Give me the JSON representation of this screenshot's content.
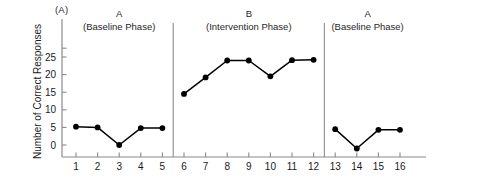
{
  "panel_label": "(A)",
  "chart_data": {
    "type": "line",
    "title": "",
    "subtitle": "",
    "xlabel": "",
    "ylabel": "Number of Correct Responses",
    "x": [
      1,
      2,
      3,
      4,
      5,
      6,
      7,
      8,
      9,
      10,
      11,
      12,
      13,
      14,
      15,
      16
    ],
    "xtick_labels": [
      "1",
      "2",
      "3",
      "4",
      "5",
      "6",
      "7",
      "8",
      "9",
      "10",
      "11",
      "12",
      "13",
      "14",
      "15",
      "16"
    ],
    "ytick_labels": [
      "0",
      "5",
      "10",
      "15",
      "20",
      "25"
    ],
    "yticks": [
      0,
      5,
      10,
      15,
      20,
      25
    ],
    "ylim": [
      -2.5,
      28
    ],
    "xlim": [
      0.4,
      17.2
    ],
    "grid": false,
    "legend": null,
    "marker": "filled-circle",
    "line_color": "#000000",
    "marker_color": "#000000",
    "axis_color": "#8a8a8a",
    "series": [
      {
        "name": "A (Baseline Phase)",
        "x": [
          1,
          2,
          3,
          4,
          5
        ],
        "values": [
          5.2,
          5.0,
          0.0,
          4.8,
          4.8
        ]
      },
      {
        "name": "B (Intervention Phase)",
        "x": [
          6,
          7,
          8,
          9,
          10,
          11,
          12
        ],
        "values": [
          14.5,
          19.2,
          24.0,
          24.0,
          19.5,
          24.1,
          24.2
        ]
      },
      {
        "name": "A (Baseline Phase)",
        "x": [
          13,
          14,
          15,
          16
        ],
        "values": [
          4.5,
          -1.0,
          4.3,
          4.3
        ]
      }
    ],
    "phases": [
      {
        "name": "A",
        "subtitle": "(Baseline Phase)",
        "x_start": 1,
        "x_end": 5
      },
      {
        "name": "B",
        "subtitle": "(Intervention Phase)",
        "x_start": 6,
        "x_end": 12
      },
      {
        "name": "A",
        "subtitle": "(Baseline Phase)",
        "x_start": 13,
        "x_end": 16
      }
    ],
    "phase_dividers": [
      5.5,
      12.5
    ]
  }
}
